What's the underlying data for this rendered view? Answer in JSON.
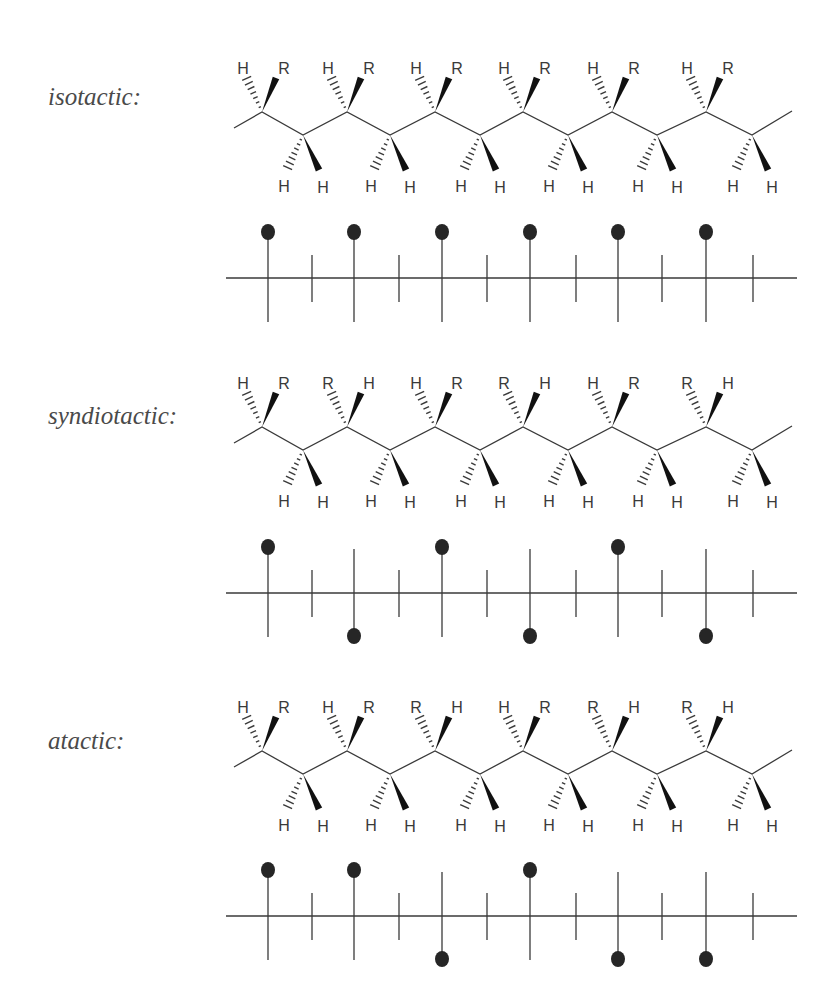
{
  "figure": {
    "sections": [
      {
        "id": "isotactic",
        "label": "isotactic:",
        "label_pos": {
          "x": 48,
          "y": 84
        },
        "chain_offset_y": 0,
        "fischer_axis_y": 278,
        "top_substituents": [
          [
            "H",
            "R"
          ],
          [
            "H",
            "R"
          ],
          [
            "H",
            "R"
          ],
          [
            "H",
            "R"
          ],
          [
            "H",
            "R"
          ],
          [
            "H",
            "R"
          ]
        ],
        "bottom_substituents": [
          [
            "H",
            "H"
          ],
          [
            "H",
            "H"
          ],
          [
            "H",
            "H"
          ],
          [
            "H",
            "H"
          ],
          [
            "H",
            "H"
          ],
          [
            "H",
            "H"
          ]
        ],
        "fischer_dots": [
          "up",
          "up",
          "up",
          "up",
          "up",
          "up"
        ]
      },
      {
        "id": "syndiotactic",
        "label": "syndiotactic:",
        "label_pos": {
          "x": 48,
          "y": 403
        },
        "chain_offset_y": 315,
        "fischer_axis_y": 593,
        "top_substituents": [
          [
            "H",
            "R"
          ],
          [
            "R",
            "H"
          ],
          [
            "H",
            "R"
          ],
          [
            "R",
            "H"
          ],
          [
            "H",
            "R"
          ],
          [
            "R",
            "H"
          ]
        ],
        "bottom_substituents": [
          [
            "H",
            "H"
          ],
          [
            "H",
            "H"
          ],
          [
            "H",
            "H"
          ],
          [
            "H",
            "H"
          ],
          [
            "H",
            "H"
          ],
          [
            "H",
            "H"
          ]
        ],
        "fischer_dots": [
          "up",
          "down",
          "up",
          "down",
          "up",
          "down"
        ]
      },
      {
        "id": "atactic",
        "label": "atactic:",
        "label_pos": {
          "x": 48,
          "y": 728
        },
        "chain_offset_y": 639,
        "fischer_axis_y": 916,
        "top_substituents": [
          [
            "H",
            "R"
          ],
          [
            "H",
            "R"
          ],
          [
            "R",
            "H"
          ],
          [
            "H",
            "R"
          ],
          [
            "R",
            "H"
          ],
          [
            "R",
            "H"
          ]
        ],
        "bottom_substituents": [
          [
            "H",
            "H"
          ],
          [
            "H",
            "H"
          ],
          [
            "H",
            "H"
          ],
          [
            "H",
            "H"
          ],
          [
            "H",
            "H"
          ],
          [
            "H",
            "H"
          ]
        ],
        "fischer_dots": [
          "up",
          "up",
          "down",
          "up",
          "down",
          "down"
        ]
      }
    ],
    "geometry": {
      "upper_carbon_x": [
        262,
        347,
        435,
        523,
        612,
        706
      ],
      "lower_carbon_x": [
        303,
        390,
        480,
        568,
        657,
        752
      ],
      "chain_start": [
        234,
        128
      ],
      "chain_end": [
        792,
        111
      ],
      "upper_y": 112,
      "lower_y": 135,
      "fischer_long_x": [
        268,
        354,
        442,
        530,
        618,
        706
      ],
      "fischer_short_x": [
        312,
        399,
        487,
        576,
        662,
        753
      ],
      "fischer_line_start_x": 226,
      "fischer_line_end_x": 797
    },
    "colors": {
      "line": "#3a3a3a",
      "wedge": "#111111",
      "dot": "#262626",
      "label": "#4a4a4a"
    }
  }
}
